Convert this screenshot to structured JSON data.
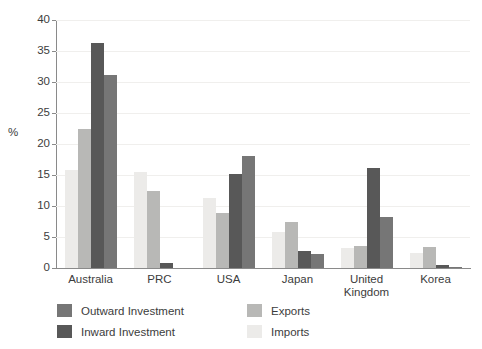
{
  "chart_data": {
    "type": "bar",
    "title": "",
    "xlabel": "",
    "ylabel": "%",
    "ylim": [
      0,
      40
    ],
    "yticks": [
      0,
      5,
      10,
      15,
      20,
      25,
      30,
      35,
      40
    ],
    "ytick_labels": [
      "0",
      "5",
      "10",
      "15",
      "20",
      "25",
      "30",
      "35",
      "40"
    ],
    "grid": true,
    "legend_position": "bottom-left",
    "categories": [
      "Australia",
      "PRC",
      "USA",
      "Japan",
      "United Kingdom",
      "Korea"
    ],
    "category_labels": [
      [
        "Australia"
      ],
      [
        "PRC"
      ],
      [
        "USA"
      ],
      [
        "Japan"
      ],
      [
        "United",
        "Kingdom"
      ],
      [
        "Korea"
      ]
    ],
    "bar_draw_order": [
      "Imports",
      "Exports",
      "Inward Investment",
      "Outward Investment"
    ],
    "series": [
      {
        "name": "Outward Investment",
        "color": "#767676",
        "values": [
          31.2,
          0.0,
          18.1,
          2.3,
          8.2,
          0.2
        ]
      },
      {
        "name": "Inward Investment",
        "color": "#585858",
        "values": [
          36.3,
          0.8,
          15.2,
          2.7,
          16.2,
          0.5
        ]
      },
      {
        "name": "Exports",
        "color": "#b8b8b6",
        "values": [
          22.5,
          12.5,
          8.8,
          7.5,
          3.6,
          3.4
        ]
      },
      {
        "name": "Imports",
        "color": "#ecebe9",
        "values": [
          15.8,
          15.5,
          11.3,
          5.8,
          3.3,
          2.5
        ]
      }
    ]
  },
  "legend": {
    "entries": [
      {
        "label": "Outward Investment",
        "color": "#767676"
      },
      {
        "label": "Exports",
        "color": "#b8b8b6"
      },
      {
        "label": "Inward Investment",
        "color": "#585858"
      },
      {
        "label": "Imports",
        "color": "#ecebe9"
      }
    ]
  },
  "axis": {
    "y_title": "%"
  }
}
